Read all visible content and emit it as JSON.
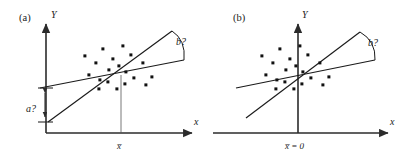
{
  "figure": {
    "caption_a": "(a)",
    "caption_b": "(b)",
    "background_color": "#ffffff",
    "ink_color": "#1a1a1a"
  },
  "panel_a": {
    "label": "(a)",
    "y_axis_label": "Y",
    "x_axis_label": "x",
    "x_tick_label": "x̅",
    "intercept_label": "a?",
    "slope_label": "b?",
    "axes": {
      "origin_x": 46,
      "origin_y": 133,
      "y_top": 20,
      "x_right": 196
    },
    "lines": [
      {
        "name": "through-origin-line",
        "x1": 48,
        "y1": 122,
        "x2": 172,
        "y2": 31
      },
      {
        "name": "least-squares-line",
        "x1": 40,
        "y1": 88,
        "x2": 184,
        "y2": 60
      }
    ],
    "intercept_bar": {
      "x": 45,
      "y_top": 88,
      "y_bottom": 122
    },
    "centroid": {
      "x": 121,
      "y": 75
    },
    "mean_drop_line": {
      "x": 121,
      "y_top": 75,
      "y_bottom": 133
    },
    "arc": {
      "start_x": 172,
      "start_y": 31,
      "end_x": 184,
      "end_y": 60
    },
    "points": [
      [
        85,
        56
      ],
      [
        103,
        49
      ],
      [
        96,
        63
      ],
      [
        113,
        59
      ],
      [
        123,
        46
      ],
      [
        109,
        70
      ],
      [
        119,
        66
      ],
      [
        131,
        55
      ],
      [
        89,
        75
      ],
      [
        100,
        80
      ],
      [
        108,
        82
      ],
      [
        125,
        84
      ],
      [
        117,
        89
      ],
      [
        134,
        78
      ],
      [
        143,
        63
      ],
      [
        152,
        77
      ],
      [
        146,
        85
      ],
      [
        126,
        72
      ],
      [
        99,
        89
      ]
    ]
  },
  "panel_b": {
    "label": "(b)",
    "y_axis_label": "Y",
    "x_axis_label": "x",
    "x_tick_label": "x̅ = 0",
    "slope_label": "b?",
    "axes": {
      "origin_x": 298,
      "origin_y": 133,
      "y_top": 20,
      "x_right": 392
    },
    "lines": [
      {
        "name": "through-origin-line",
        "x1": 246,
        "y1": 118,
        "x2": 360,
        "y2": 32
      },
      {
        "name": "least-squares-line",
        "x1": 236,
        "y1": 88,
        "x2": 375,
        "y2": 60
      }
    ],
    "centroid": {
      "x": 298,
      "y": 75
    },
    "arc": {
      "start_x": 360,
      "start_y": 32,
      "end_x": 375,
      "end_y": 60
    },
    "points": [
      [
        262,
        56
      ],
      [
        280,
        49
      ],
      [
        273,
        63
      ],
      [
        290,
        59
      ],
      [
        300,
        46
      ],
      [
        286,
        70
      ],
      [
        296,
        66
      ],
      [
        308,
        55
      ],
      [
        266,
        75
      ],
      [
        277,
        80
      ],
      [
        285,
        82
      ],
      [
        302,
        84
      ],
      [
        294,
        89
      ],
      [
        311,
        78
      ],
      [
        320,
        63
      ],
      [
        329,
        77
      ],
      [
        323,
        85
      ],
      [
        303,
        72
      ],
      [
        276,
        89
      ]
    ]
  }
}
